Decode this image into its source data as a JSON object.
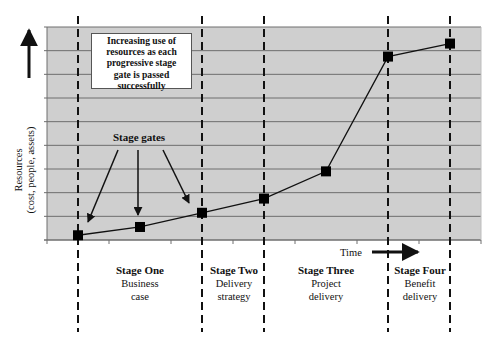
{
  "chart_data": {
    "type": "line",
    "title": "",
    "xlabel": "Time",
    "ylabel": "Resources",
    "ylabel_sub": "(cost, people, assets)",
    "xlim": [
      0,
      7
    ],
    "ylim": [
      0,
      9
    ],
    "grid": "horizontal",
    "x_tick_count": 8,
    "y_tick_count": 10,
    "series": [
      {
        "name": "Resources",
        "marker": "square",
        "x": [
          0.5,
          1.5,
          2.5,
          3.5,
          4.5,
          5.5,
          6.5
        ],
        "values": [
          0.2,
          0.55,
          1.15,
          1.75,
          2.9,
          7.75,
          8.3
        ]
      }
    ],
    "stage_gates_x": [
      0.5,
      2.5,
      3.5,
      5.5,
      6.5
    ],
    "stages": [
      {
        "title": "Stage One",
        "desc_line1": "Business",
        "desc_line2": "case"
      },
      {
        "title": "Stage Two",
        "desc_line1": "Delivery",
        "desc_line2": "strategy"
      },
      {
        "title": "Stage Three",
        "desc_line1": "Project",
        "desc_line2": "delivery"
      },
      {
        "title": "Stage Four",
        "desc_line1": "Benefit",
        "desc_line2": "delivery"
      }
    ],
    "annotations": {
      "callout_lines": [
        "Increasing use of",
        "resources as each",
        "progressive stage",
        "gate is passed",
        "successfully"
      ],
      "stage_gates_label": "Stage gates"
    }
  },
  "colors": {
    "plot_bg": "#cfcfcf",
    "grid": "#6e6e6e",
    "line": "#111111",
    "marker": "#000000"
  }
}
